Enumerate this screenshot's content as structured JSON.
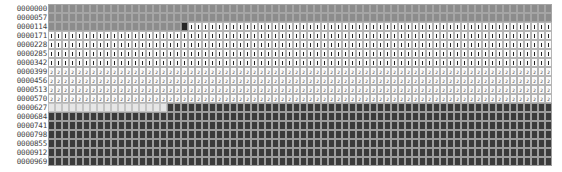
{
  "view": {
    "columns": 72,
    "legend": {
      "u": "unallocated / gray",
      "s": "selected marker (dark)",
      "f1": "file fragment 1",
      "f2": "file fragment 2",
      "e": "empty",
      "d": "used / dark"
    },
    "rows": [
      {
        "address": "0000000",
        "segments": [
          [
            "u",
            72
          ]
        ]
      },
      {
        "address": "0000057",
        "segments": [
          [
            "u",
            72
          ]
        ]
      },
      {
        "address": "0000114",
        "segments": [
          [
            "u",
            19
          ],
          [
            "s",
            1
          ],
          [
            "f1",
            52
          ]
        ]
      },
      {
        "address": "0000171",
        "segments": [
          [
            "f1",
            72
          ]
        ]
      },
      {
        "address": "0000228",
        "segments": [
          [
            "f1",
            72
          ]
        ]
      },
      {
        "address": "0000285",
        "segments": [
          [
            "f1",
            72
          ]
        ]
      },
      {
        "address": "0000342",
        "segments": [
          [
            "f1",
            72
          ]
        ]
      },
      {
        "address": "0000399",
        "segments": [
          [
            "f2",
            72
          ]
        ]
      },
      {
        "address": "0000456",
        "segments": [
          [
            "f2",
            72
          ]
        ]
      },
      {
        "address": "0000513",
        "segments": [
          [
            "f2",
            72
          ]
        ]
      },
      {
        "address": "0000570",
        "segments": [
          [
            "f2",
            72
          ]
        ]
      },
      {
        "address": "0000627",
        "segments": [
          [
            "e",
            17
          ],
          [
            "d",
            55
          ]
        ]
      },
      {
        "address": "0000684",
        "segments": [
          [
            "d",
            72
          ]
        ]
      },
      {
        "address": "0000741",
        "segments": [
          [
            "d",
            72
          ]
        ]
      },
      {
        "address": "0000798",
        "segments": [
          [
            "d",
            72
          ]
        ]
      },
      {
        "address": "0000855",
        "segments": [
          [
            "d",
            72
          ]
        ]
      },
      {
        "address": "0000912",
        "segments": [
          [
            "d",
            72
          ]
        ]
      },
      {
        "address": "0000969",
        "segments": [
          [
            "d",
            72
          ]
        ]
      }
    ],
    "glyphs": {
      "f1": "1",
      "f2": "2"
    }
  }
}
